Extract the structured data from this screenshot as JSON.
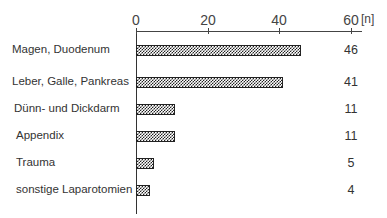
{
  "chart_data": {
    "type": "bar",
    "orientation": "horizontal",
    "title": "",
    "xlabel": "",
    "ylabel": "",
    "unit": "[n]",
    "xlim": [
      0,
      60
    ],
    "xticks": [
      "0",
      "20",
      "40",
      "60"
    ],
    "grid": false,
    "legend": null,
    "categories": [
      "Magen, Duodenum",
      "Leber, Galle, Pankreas",
      "Dünn-  und Dickdarm",
      "Appendix",
      "Trauma",
      "sonstige Laparotomien"
    ],
    "values": [
      46,
      41,
      11,
      11,
      5,
      4
    ],
    "value_labels": [
      "46",
      "41",
      "11",
      "11",
      "5",
      "4"
    ]
  }
}
